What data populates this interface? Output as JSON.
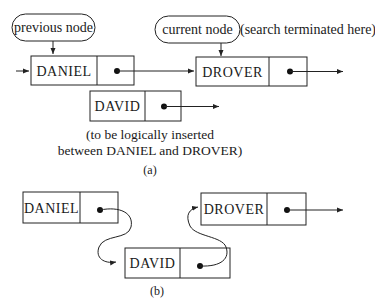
{
  "part_a": {
    "previous_label": "previous node",
    "current_label": "current node",
    "current_note": "(search terminated here)",
    "nodes": [
      {
        "name": "DANIEL"
      },
      {
        "name": "DROVER"
      },
      {
        "name": "DAVID"
      }
    ],
    "caption_line1": "(to be logically inserted",
    "caption_line2": "between DANIEL and DROVER)",
    "figure_label": "(a)"
  },
  "part_b": {
    "nodes": [
      {
        "name": "DANIEL"
      },
      {
        "name": "DAVID"
      },
      {
        "name": "DROVER"
      }
    ],
    "figure_label": "(b)"
  },
  "colors": {
    "ink": "#1a1a1a",
    "background": "#ffffff"
  }
}
